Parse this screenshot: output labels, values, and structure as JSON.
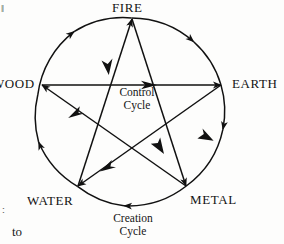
{
  "diagram": {
    "shape": "pentagram-in-circle",
    "stroke_color": "#111111",
    "background_color": "#fdfdfc",
    "nodes": [
      {
        "id": "fire",
        "label": "FIRE",
        "position": "top",
        "x": 132,
        "y": 19
      },
      {
        "id": "earth",
        "label": "EARTH",
        "position": "right",
        "x": 221,
        "y": 85
      },
      {
        "id": "metal",
        "label": "METAL",
        "position": "bottom-right",
        "x": 186,
        "y": 186
      },
      {
        "id": "water",
        "label": "WATER",
        "position": "bottom-left",
        "x": 78,
        "y": 186
      },
      {
        "id": "wood",
        "label": "WOOD",
        "position": "left",
        "x": 42,
        "y": 85
      }
    ],
    "circle": {
      "cx": 131.5,
      "cy": 112,
      "r": 94
    },
    "creation_cycle": {
      "label_line_1": "Creation",
      "label_line_2": "Cycle",
      "direction": "clockwise",
      "edges": [
        {
          "from": "wood",
          "to": "fire"
        },
        {
          "from": "fire",
          "to": "earth"
        },
        {
          "from": "earth",
          "to": "metal"
        },
        {
          "from": "metal",
          "to": "water"
        },
        {
          "from": "water",
          "to": "wood"
        }
      ]
    },
    "control_cycle": {
      "label_line_1": "Control",
      "label_line_2": "Cycle",
      "edges": [
        {
          "from": "wood",
          "to": "earth"
        },
        {
          "from": "earth",
          "to": "water"
        },
        {
          "from": "water",
          "to": "fire"
        },
        {
          "from": "fire",
          "to": "metal"
        },
        {
          "from": "metal",
          "to": "wood"
        }
      ]
    }
  },
  "page_scraps": {
    "bottom_text": "to",
    "left_mark": "∶",
    "top_mark": "‖"
  }
}
